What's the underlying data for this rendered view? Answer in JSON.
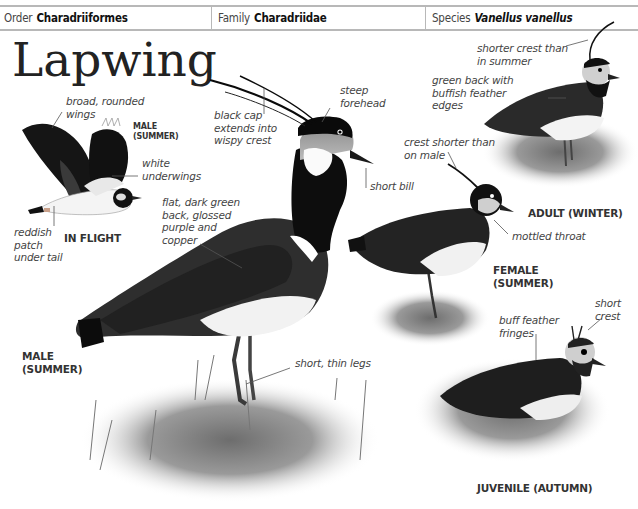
{
  "header": {
    "order_label": "Order",
    "order_value": "Charadriiformes",
    "family_label": "Family",
    "family_value": "Charadriidae",
    "species_label": "Species",
    "species_value": "Vanellus vanellus"
  },
  "title": "Lapwing",
  "colors": {
    "header_border": "#b8b8b8",
    "bird_black": "#111111",
    "bird_back": "#2e2e2e",
    "grass": "#8a8a8a",
    "label_text": "#444444"
  },
  "figures": {
    "in_flight": {
      "caption": "IN FLIGHT",
      "sub_caption": "MALE\n(SUMMER)",
      "labels": [
        {
          "text": "broad, rounded\nwings"
        },
        {
          "text": "white\nunderwings"
        },
        {
          "text": "reddish\npatch\nunder tail"
        }
      ]
    },
    "male_summer": {
      "caption": "MALE\n(SUMMER)",
      "labels": [
        {
          "text": "black cap\nextends into\nwispy crest"
        },
        {
          "text": "steep\nforehead"
        },
        {
          "text": "short bill"
        },
        {
          "text": "flat, dark green\nback, glossed\npurple and\ncopper"
        },
        {
          "text": "short, thin legs"
        }
      ]
    },
    "adult_winter": {
      "caption": "ADULT (WINTER)",
      "labels": [
        {
          "text": "shorter crest than\nin summer"
        },
        {
          "text": "green back with\nbuffish feather\nedges"
        }
      ]
    },
    "female_summer": {
      "caption": "FEMALE\n(SUMMER)",
      "labels": [
        {
          "text": "crest shorter than\non male"
        },
        {
          "text": "mottled throat"
        }
      ]
    },
    "juvenile_autumn": {
      "caption": "JUVENILE (AUTUMN)",
      "labels": [
        {
          "text": "buff feather\nfringes"
        },
        {
          "text": "short\ncrest"
        }
      ]
    }
  }
}
